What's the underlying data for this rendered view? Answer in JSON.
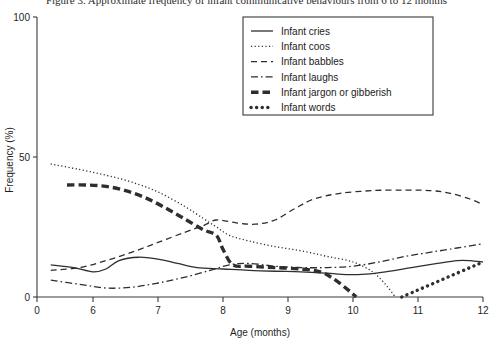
{
  "caption": "Figure 3. Approximate frequency of infant communicative behaviours from 6 to 12 months",
  "chart_data": {
    "type": "line",
    "title": "",
    "xlabel": "Age (months)",
    "ylabel": "Frequency (%)",
    "xlim": [
      5.3,
      12
    ],
    "ylim": [
      0,
      100
    ],
    "xticks": [
      0,
      6,
      7,
      8,
      9,
      10,
      11,
      12
    ],
    "xtick_labels": [
      "0",
      "6",
      "7",
      "8",
      "9",
      "10",
      "11",
      "12"
    ],
    "yticks": [
      0,
      50,
      100
    ],
    "ytick_labels": [
      "0",
      "50",
      "100"
    ],
    "grid": false,
    "legend_position": "top-right",
    "series": [
      {
        "name": "Infant cries",
        "style": "solid",
        "x": [
          5.35,
          5.7,
          6.0,
          6.2,
          6.4,
          6.7,
          7.0,
          7.3,
          7.6,
          8.0,
          8.4,
          8.8,
          9.2,
          9.6,
          9.9,
          10.2,
          10.5,
          10.9,
          11.3,
          11.6,
          11.8,
          12.0
        ],
        "values": [
          11.5,
          10.5,
          9.0,
          10.0,
          13.0,
          14.2,
          13.5,
          12.0,
          10.5,
          10.0,
          9.5,
          9.2,
          9.0,
          8.5,
          8.0,
          8.2,
          9.0,
          10.5,
          12.0,
          13.0,
          13.0,
          12.5
        ]
      },
      {
        "name": "Infant coos",
        "style": "dotted",
        "x": [
          5.35,
          5.8,
          6.2,
          6.6,
          7.0,
          7.4,
          7.7,
          7.9,
          8.1,
          8.4,
          8.8,
          9.2,
          9.6,
          10.0,
          10.3,
          10.5,
          10.65
        ],
        "values": [
          47.5,
          45.5,
          43.5,
          41.0,
          37.5,
          32.5,
          28.0,
          25.0,
          22.0,
          20.0,
          18.0,
          16.5,
          14.5,
          12.5,
          9.0,
          4.5,
          0.0
        ]
      },
      {
        "name": "Infant babbles",
        "style": "dashed",
        "x": [
          5.35,
          5.8,
          6.2,
          6.6,
          7.0,
          7.4,
          7.7,
          7.9,
          8.2,
          8.5,
          8.8,
          9.1,
          9.4,
          9.8,
          10.3,
          10.8,
          11.2,
          11.5,
          11.8,
          12.0
        ],
        "values": [
          9.5,
          10.5,
          13.0,
          16.0,
          19.5,
          23.0,
          25.5,
          27.5,
          26.5,
          26.0,
          27.5,
          31.5,
          35.0,
          37.0,
          38.0,
          38.2,
          38.0,
          37.0,
          35.0,
          33.0
        ]
      },
      {
        "name": "Infant laughs",
        "style": "dashdot",
        "x": [
          5.35,
          5.8,
          6.2,
          6.6,
          7.0,
          7.4,
          7.8,
          8.1,
          8.4,
          8.8,
          9.2,
          9.6,
          10.0,
          10.4,
          10.8,
          11.2,
          11.6,
          12.0
        ],
        "values": [
          6.0,
          4.5,
          3.2,
          3.5,
          5.0,
          7.0,
          9.5,
          11.5,
          12.0,
          11.0,
          10.5,
          10.5,
          11.0,
          12.5,
          14.5,
          16.0,
          17.5,
          19.0
        ]
      },
      {
        "name": "Infant jargon or gibberish",
        "style": "thick-dashed",
        "x": [
          5.6,
          5.9,
          6.2,
          6.5,
          6.8,
          7.1,
          7.4,
          7.7,
          7.9,
          8.0,
          8.15,
          8.4,
          8.8,
          9.2,
          9.5,
          9.7,
          9.9,
          10.05
        ],
        "values": [
          40.0,
          40.0,
          39.5,
          38.0,
          35.5,
          32.0,
          28.0,
          24.0,
          22.0,
          17.0,
          11.5,
          11.0,
          10.5,
          10.0,
          9.0,
          6.5,
          3.0,
          0.0
        ]
      },
      {
        "name": "Infant words",
        "style": "thick-dotted",
        "x": [
          10.75,
          10.95,
          11.15,
          11.35,
          11.55,
          11.75,
          11.9,
          12.0
        ],
        "values": [
          0.0,
          2.0,
          4.0,
          6.0,
          8.0,
          10.0,
          11.5,
          12.5
        ]
      }
    ]
  }
}
